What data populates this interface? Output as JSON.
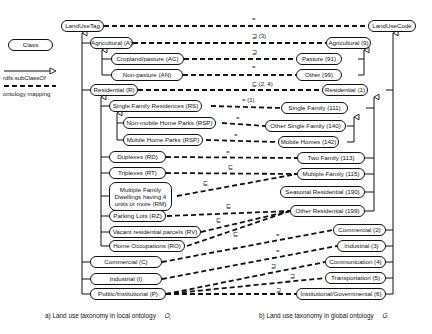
{
  "legend": {
    "class_label": "Class",
    "subclass_label": "rdfs:subClassOf",
    "mapping_label": "ontology mapping"
  },
  "local": {
    "root": "LandUseTag",
    "nodes": {
      "agricultural": "Agricultural (A)",
      "cropland": "Cropland/pasture (AC)",
      "nonpasture": "Non-pasture (AN)",
      "residential": "Residential (R)",
      "sfr": "Single Family Residences (RS)",
      "nonmobile": "Non-mobile Home Parks (RSP)",
      "mobile": "Mobile Home Parks (RSP)",
      "duplexes": "Duplexes (RD)",
      "triplexes": "Triplexes (RT)",
      "multiple": "Multiple Family Dwellings having 4 units or more (RM)",
      "parking": "Parking Lots (RZ)",
      "vacant": "Vacant residential parcels (RV)",
      "homeocc": "Home Occupations (RO)",
      "commercial": "Commercial (C)",
      "industrial": "Industrial (I)",
      "public": "Public/Institutional (P)"
    },
    "caption": "a) Land use taxonomy in local ontology",
    "caption_symbol": "O",
    "caption_sub": "l"
  },
  "global": {
    "root": "LandUseCode",
    "nodes": {
      "agricultural": "Agricultural (9)",
      "pasture": "Pasture (91)",
      "other": "Other (99)",
      "residential": "Residential (1)",
      "single": "Single Family (111)",
      "othersingle": "Other Single Family (140)",
      "mobile": "Mobile Homes (142)",
      "two": "Two Family (113)",
      "multiple": "Multiple Family (115)",
      "seasonal": "Seasonal Residential (190)",
      "otherres": "Other Residential (199)",
      "commercial": "Commercial (2)",
      "industrial": "Industrial (3)",
      "communication": "Communication (4)",
      "transportation": "Transportation (5)",
      "institutional": "Institutional/Governmental (6)"
    },
    "caption": "b) Land use taxonomy in global ontology",
    "caption_symbol": "G"
  },
  "mappings": [
    {
      "from": "LandUseTag",
      "to": "LandUseCode",
      "relation": "="
    },
    {
      "from": "Agricultural (A)",
      "to": "Agricultural (9)",
      "relation": "⊒ (3)"
    },
    {
      "from": "Cropland/pasture (AC)",
      "to": "Pasture (91)",
      "relation": "⊒"
    },
    {
      "from": "Non-pasture (AN)",
      "to": "Other (99)",
      "relation": "="
    },
    {
      "from": "Residential (R)",
      "to": "Residential (1)",
      "relation": "⊑ (2, 4)"
    },
    {
      "from": "Single Family Residences (RS)",
      "to": "Single Family (111)",
      "relation": "= (1)"
    },
    {
      "from": "Non-mobile Home Parks (RSP)",
      "to": "Other Single Family (140)",
      "relation": "="
    },
    {
      "from": "Mobile Home Parks (RSP)",
      "to": "Mobile Homes (142)",
      "relation": "="
    },
    {
      "from": "Duplexes (RD)",
      "to": "Two Family (113)",
      "relation": "="
    },
    {
      "from": "Triplexes (RT)",
      "to": "Multiple Family (115)",
      "relation": "⊑"
    },
    {
      "from": "Multiple Family Dwellings having 4 units or more (RM)",
      "to": "Multiple Family (115)",
      "relation": "⊑"
    },
    {
      "from": "Parking Lots (RZ)",
      "to": "Other Residential (199)",
      "relation": "⊑"
    },
    {
      "from": "Vacant residential parcels (RV)",
      "to": "Other Residential (199)",
      "relation": "⊑"
    },
    {
      "from": "Home Occupations (RO)",
      "to": "Other Residential (199)",
      "relation": "⊑"
    },
    {
      "from": "Commercial (C)",
      "to": "Commercial (2)",
      "relation": "="
    },
    {
      "from": "Industrial (I)",
      "to": "Industrial (3)",
      "relation": "="
    },
    {
      "from": "Public/Institutional (P)",
      "to": "Communication (4)",
      "relation": "⊒"
    },
    {
      "from": "Public/Institutional (P)",
      "to": "Transportation (5)",
      "relation": "⊒"
    },
    {
      "from": "Public/Institutional (P)",
      "to": "Institutional/Governmental (6)",
      "relation": "⊒"
    }
  ],
  "relation_labels": {
    "root": "=",
    "agri": "⊒ (3)",
    "crop": "⊒",
    "nonpast": "=",
    "res": "⊑ (2, 4)",
    "sfr": "= (1)",
    "nonmobile": "=",
    "mobile": "=",
    "duplex": "=",
    "triplex": "⊑",
    "multi": "⊑",
    "parking": "⊑",
    "vacant": "⊑",
    "homeocc": "⊑",
    "commercial": "=",
    "industrial": "=",
    "comm": "⊒",
    "trans": "⊒",
    "inst": "⊒"
  }
}
